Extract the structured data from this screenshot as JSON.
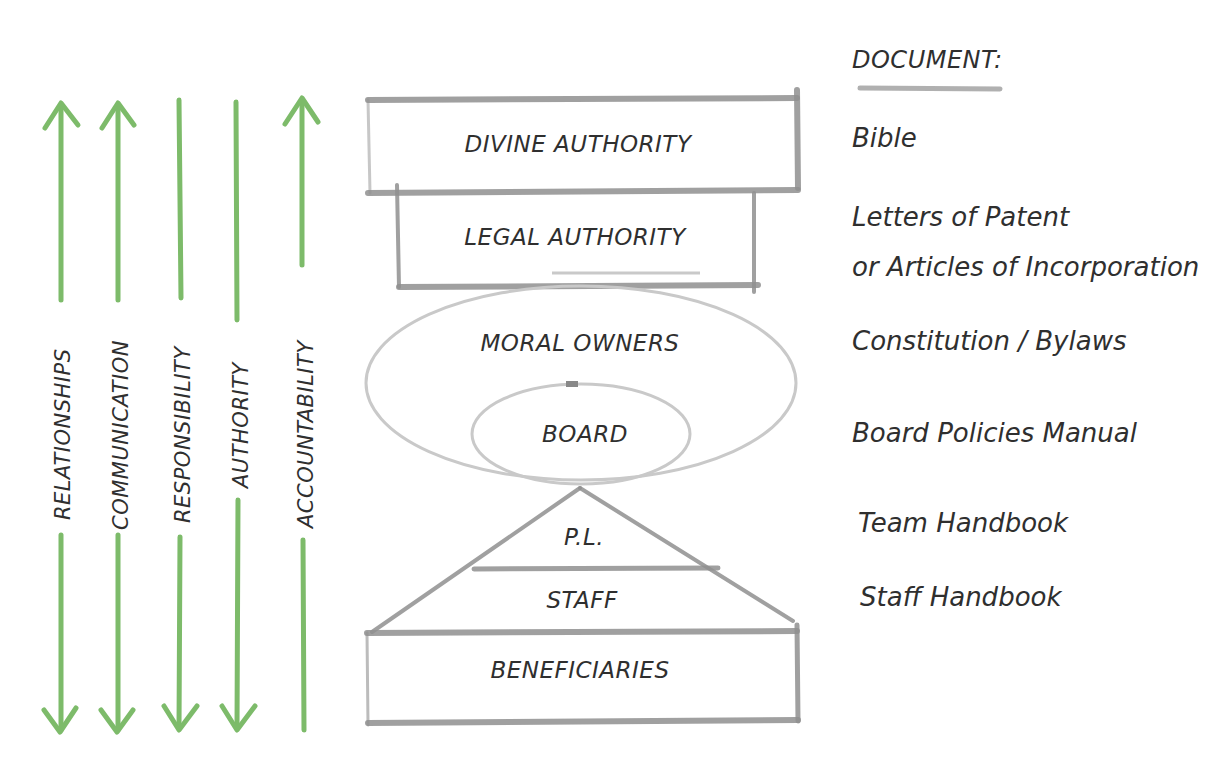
{
  "colors": {
    "arrow_green": "#7dbb6a",
    "pencil_gray": "#8f8f8f",
    "ellipse_gray": "#c9c9c9",
    "ink": "#2f2f2f",
    "background": "#ffffff"
  },
  "principles": [
    {
      "label": "RELATIONSHIPS",
      "direction": "both"
    },
    {
      "label": "COMMUNICATION",
      "direction": "both"
    },
    {
      "label": "RESPONSIBILITY",
      "direction": "down"
    },
    {
      "label": "AUTHORITY",
      "direction": "down"
    },
    {
      "label": "ACCOUNTABILITY",
      "direction": "up"
    }
  ],
  "hierarchy": {
    "divine_authority": "DIVINE AUTHORITY",
    "legal_authority": "LEGAL AUTHORITY",
    "moral_owners": "MORAL OWNERS",
    "board": "BOARD",
    "pl": "P.L.",
    "staff": "STAFF",
    "beneficiaries": "BENEFICIARIES"
  },
  "documents": {
    "header": "DOCUMENT:",
    "items": [
      {
        "level": "divine_authority",
        "lines": [
          "Bible"
        ]
      },
      {
        "level": "legal_authority",
        "lines": [
          "Letters of Patent",
          "or Articles of Incorporation"
        ]
      },
      {
        "level": "moral_owners",
        "lines": [
          "Constitution / Bylaws"
        ]
      },
      {
        "level": "board",
        "lines": [
          "Board Policies Manual"
        ]
      },
      {
        "level": "pl",
        "lines": [
          "Team Handbook"
        ]
      },
      {
        "level": "staff",
        "lines": [
          "Staff Handbook"
        ]
      }
    ]
  }
}
